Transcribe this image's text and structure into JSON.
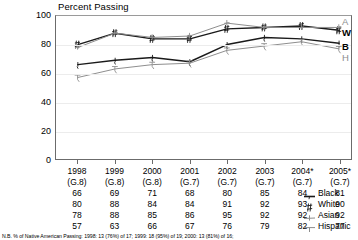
{
  "chart_data": {
    "type": "line",
    "title": "Percent Passing",
    "xlabel": "",
    "ylabel": "",
    "ylim": [
      0,
      100
    ],
    "yticks": [
      "0",
      "20",
      "40",
      "60",
      "80",
      "100"
    ],
    "grid": true,
    "legend_position": "right-of-table",
    "categories": [
      "1998",
      "1999",
      "2000",
      "2001",
      "2002",
      "2003",
      "2004*",
      "2005*"
    ],
    "category_sublabels": [
      "(G.8)",
      "(G.8)",
      "(G.8)",
      "(G.7)",
      "(G.7)",
      "(G.7)",
      "(G.7)",
      "(G.7)"
    ],
    "series": [
      {
        "name": "Black",
        "short": "B",
        "marker": "dash",
        "color": "#1a1a1a",
        "values": [
          66,
          69,
          71,
          68,
          80,
          85,
          84,
          81
        ]
      },
      {
        "name": "White",
        "short": "W",
        "marker": "hash",
        "color": "#1a1a1a",
        "values": [
          80,
          88,
          84,
          84,
          91,
          92,
          93,
          90
        ]
      },
      {
        "name": "Asian",
        "short": "A",
        "marker": "plus",
        "color": "#8d8d8d",
        "values": [
          78,
          88,
          85,
          86,
          95,
          92,
          92,
          92
        ]
      },
      {
        "name": "Hispanic",
        "short": "H",
        "marker": "tee",
        "color": "#8d8d8d",
        "values": [
          57,
          63,
          66,
          67,
          76,
          79,
          82,
          77
        ]
      }
    ],
    "annotations": {
      "footnote": "N.B. % of Native American Passing:  1998: 13 (76%) of 17; 1999: 18 (95%) of 19; 2000: 13 (81%) of 16;"
    }
  },
  "colors": {
    "dark": "#1a1a1a",
    "gray": "#8d8d8d",
    "axis": "#6b6b6b",
    "grid": "#ececec",
    "background": "#ffffff"
  }
}
